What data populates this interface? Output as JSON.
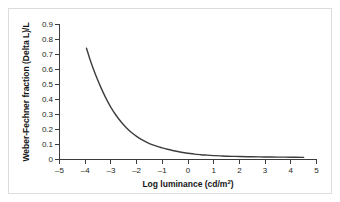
{
  "figure": {
    "background_color": "#ffffff",
    "frame_color": "#dcdcdc",
    "curve_color": "#3d3d3d",
    "axis_color": "#3b3b3b"
  },
  "chart_data": {
    "type": "line",
    "title": "",
    "xlabel": "Log luminance (cd/m²)",
    "xlabel_main": "Log luminance (cd/m",
    "xlabel_sup": "2",
    "xlabel_tail": ")",
    "ylabel": "Weber-Fechner fraction (Delta L)/L",
    "xlim": [
      -5,
      5
    ],
    "ylim": [
      0,
      0.9
    ],
    "grid": false,
    "legend": "none",
    "xticks": [
      -5,
      -4,
      -3,
      -2,
      -1,
      0,
      1,
      2,
      3,
      4,
      5
    ],
    "xticklabels": [
      "–5",
      "–4",
      "–3",
      "–2",
      "–1",
      "0",
      "1",
      "2",
      "3",
      "4",
      "5"
    ],
    "yticks": [
      0,
      0.1,
      0.2,
      0.3,
      0.4,
      0.5,
      0.6,
      0.7,
      0.8,
      0.9
    ],
    "yticklabels": [
      "0",
      "0.1",
      "0.2",
      "0.3",
      "0.4",
      "0.5",
      "0.6",
      "0.7",
      "0.8",
      "0.9"
    ],
    "series": [
      {
        "name": "Weber-Fechner fraction",
        "x": [
          -3.95,
          -3.8,
          -3.6,
          -3.4,
          -3.2,
          -3.0,
          -2.8,
          -2.6,
          -2.4,
          -2.2,
          -2.0,
          -1.8,
          -1.6,
          -1.4,
          -1.2,
          -1.0,
          -0.8,
          -0.6,
          -0.4,
          -0.2,
          0.0,
          0.25,
          0.5,
          0.75,
          1.0,
          1.25,
          1.5,
          1.75,
          2.0,
          2.5,
          3.0,
          3.5,
          4.0,
          4.5
        ],
        "y": [
          0.742,
          0.66,
          0.566,
          0.484,
          0.411,
          0.348,
          0.295,
          0.25,
          0.212,
          0.18,
          0.154,
          0.132,
          0.114,
          0.099,
          0.087,
          0.077,
          0.068,
          0.06,
          0.053,
          0.047,
          0.042,
          0.036,
          0.032,
          0.029,
          0.026,
          0.024,
          0.022,
          0.021,
          0.02,
          0.018,
          0.017,
          0.016,
          0.015,
          0.014
        ]
      }
    ]
  }
}
